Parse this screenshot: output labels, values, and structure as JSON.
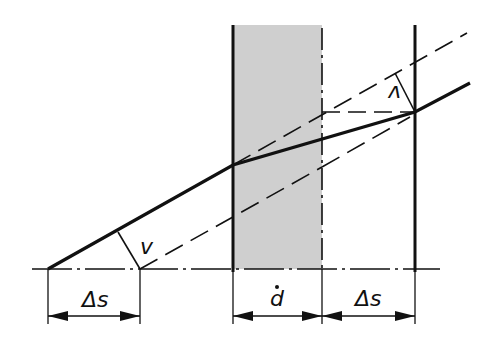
{
  "diagram": {
    "labels": {
      "delta_s_left": "Δs",
      "thickness": "d",
      "delta_s_right": "Δs",
      "angle_left": "v",
      "angle_right": "v"
    },
    "colors": {
      "line": "#111111",
      "slab_fill": "#cfcfcf",
      "background": "#ffffff"
    }
  }
}
